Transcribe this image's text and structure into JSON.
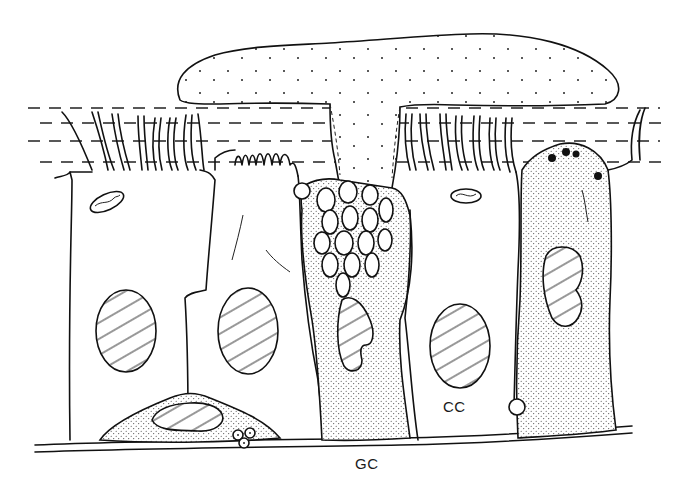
{
  "figure": {
    "type": "histology line drawing",
    "labels": {
      "ciliated_cell": "CC",
      "basal_label": "GC"
    }
  },
  "colors": {
    "line": "#111111",
    "background": "#ffffff"
  }
}
